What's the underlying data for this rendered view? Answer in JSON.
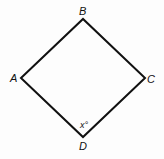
{
  "figure": {
    "shape": "quadrilateral",
    "vertices": [
      {
        "label": "A",
        "x": 21,
        "y": 78
      },
      {
        "label": "B",
        "x": 83,
        "y": 19
      },
      {
        "label": "C",
        "x": 145,
        "y": 78
      },
      {
        "label": "D",
        "x": 83,
        "y": 137
      }
    ],
    "angle_label": "x°",
    "angle_vertex": "D",
    "stroke_color": "#111111"
  }
}
